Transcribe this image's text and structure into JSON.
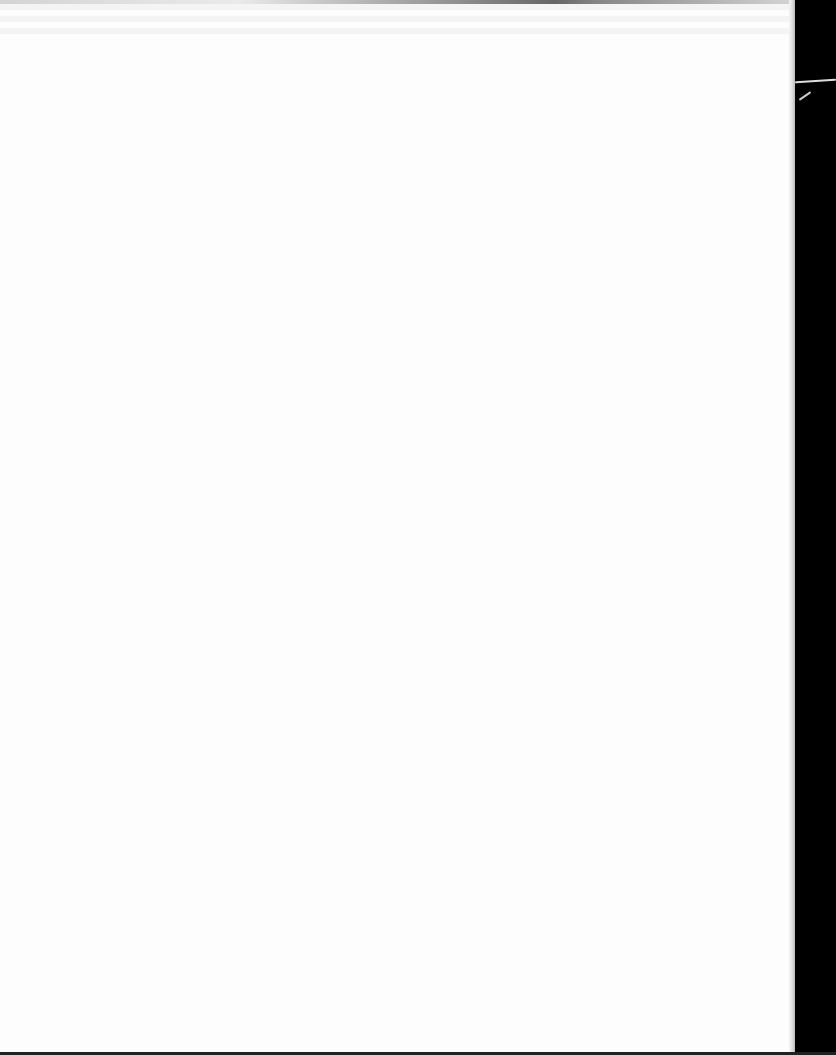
{
  "document": {
    "type": "scanned-page",
    "content": "",
    "colors": {
      "paper": "#fdfdfd",
      "background": "#000000"
    }
  }
}
